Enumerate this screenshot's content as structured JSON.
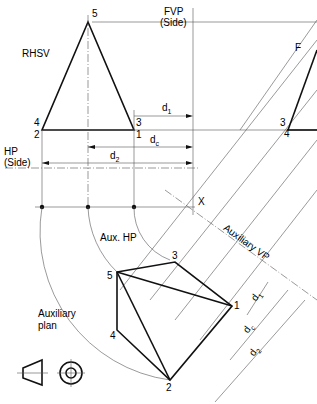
{
  "labels": {
    "rhsv": "RHSV",
    "fvp_line1": "FVP",
    "fvp_line2": "(Side)",
    "hp_line1": "HP",
    "hp_line2": "(Side)",
    "f": "F",
    "x": "X",
    "aux_hp": "Aux. HP",
    "auxiliary_vp": "Auxiliary VP",
    "aux_plan_line1": "Auxiliary",
    "aux_plan_line2": "plan"
  },
  "points": {
    "p1": "1",
    "p2": "2",
    "p3": "3",
    "p4": "4",
    "p5": "5"
  },
  "dimensions": {
    "d": "d",
    "sub1": "1",
    "subc": "c",
    "sub2": "2"
  }
}
